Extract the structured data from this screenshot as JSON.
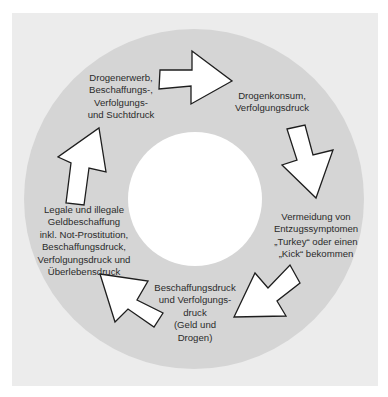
{
  "diagram": {
    "type": "cycle",
    "colors": {
      "frame_background": "#ececec",
      "ring": "#d5d5d5",
      "center": "#ffffff",
      "arrow_fill": "#ffffff",
      "arrow_stroke": "#1e1e1e",
      "text": "#2b2b2b"
    },
    "stages": [
      {
        "id": "drogenerwerb",
        "lines": [
          "Drogenerwerb,",
          "Beschaffungs-,",
          "Verfolgungs-",
          "und Suchtdruck"
        ]
      },
      {
        "id": "drogenkonsum",
        "lines": [
          "Drogenkonsum,",
          "Verfolgungsdruck"
        ]
      },
      {
        "id": "vermeidung",
        "lines": [
          "Vermeidung von",
          "Entzugssymptomen",
          "„Turkey“ oder einen",
          "„Kick“ bekommen"
        ]
      },
      {
        "id": "beschaffungsdruck",
        "lines": [
          "Beschaffungsdruck",
          "und Verfolgungs-",
          "druck",
          "(Geld und",
          "Drogen)"
        ]
      },
      {
        "id": "geldbeschaffung",
        "lines": [
          "Legale und illegale",
          "Geldbeschaffung",
          "inkl. Not-Prostitution,",
          "Beschaffungsdruck,",
          "Verfolgungsdruck und",
          "Überlebensdruck"
        ]
      }
    ],
    "arrows": [
      {
        "from": "drogenerwerb",
        "to": "drogenkonsum",
        "direction": "right"
      },
      {
        "from": "drogenkonsum",
        "to": "vermeidung",
        "direction": "down"
      },
      {
        "from": "vermeidung",
        "to": "beschaffungsdruck",
        "direction": "down-left"
      },
      {
        "from": "beschaffungsdruck",
        "to": "geldbeschaffung",
        "direction": "up-left"
      },
      {
        "from": "geldbeschaffung",
        "to": "drogenerwerb",
        "direction": "up"
      }
    ]
  }
}
